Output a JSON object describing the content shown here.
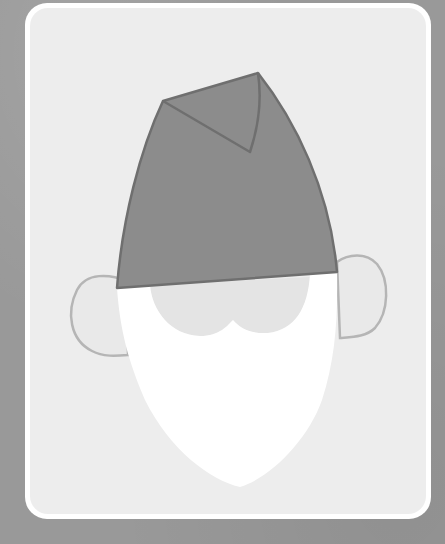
{
  "illustration": {
    "subject": "gnome-face",
    "parts": [
      "hat",
      "hat-fold",
      "left-ear",
      "right-ear",
      "face",
      "beard"
    ]
  },
  "colors": {
    "background": "#999999",
    "card_border": "#ffffff",
    "card_fill": "#ededed",
    "hat_fill": "#8c8c8c",
    "hat_stroke": "#6f6f6f",
    "ear_fill": "#e9e9e9",
    "ear_stroke": "#b5b5b5",
    "face_fill": "#e4e4e4",
    "beard_fill": "#ffffff"
  }
}
